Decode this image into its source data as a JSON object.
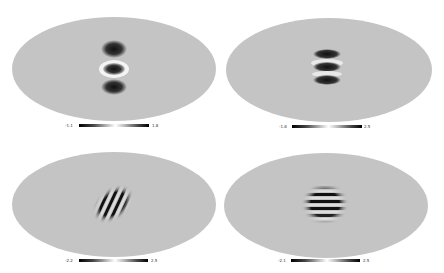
{
  "panels": [
    {
      "id": "top-left",
      "pattern": "vertical-triple-lobe",
      "colorbar": {
        "min": "-1.1",
        "max": "1.8"
      }
    },
    {
      "id": "top-right",
      "pattern": "horizontal-stripes-narrow",
      "colorbar": {
        "min": "-1.8",
        "max": "2.5"
      }
    },
    {
      "id": "bottom-left",
      "pattern": "tilted-stripes",
      "colorbar": {
        "min": "-2.2",
        "max": "2.5"
      }
    },
    {
      "id": "bottom-right",
      "pattern": "horizontal-stripes-wide",
      "colorbar": {
        "min": "-2.1",
        "max": "2.5"
      }
    }
  ],
  "colors": {
    "background": "#ffffff",
    "map_fill": "#c4c4c4",
    "colormap": "grayscale"
  }
}
